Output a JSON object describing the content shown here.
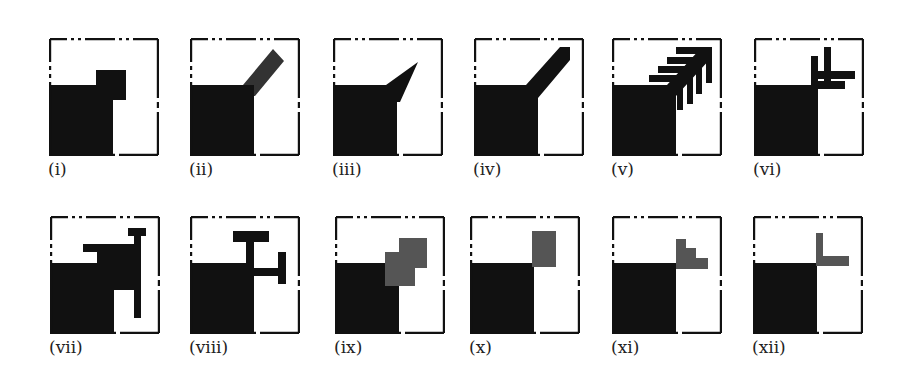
{
  "figure": {
    "panels": [
      {
        "id": "i",
        "label": "(i)",
        "x": 49,
        "y": 38,
        "desc": "square notch step"
      },
      {
        "id": "ii",
        "label": "(ii)",
        "x": 190,
        "y": 38,
        "desc": "diagonal bar gray"
      },
      {
        "id": "iii",
        "label": "(iii)",
        "x": 333,
        "y": 38,
        "desc": "triangle spike"
      },
      {
        "id": "iv",
        "label": "(iv)",
        "x": 474,
        "y": 38,
        "desc": "diagonal bar black"
      },
      {
        "id": "v",
        "label": "(v)",
        "x": 612,
        "y": 38,
        "desc": "arrow with teeth"
      },
      {
        "id": "vi",
        "label": "(vi)",
        "x": 754,
        "y": 38,
        "desc": "crossed bars"
      },
      {
        "id": "vii",
        "label": "(vii)",
        "x": 50,
        "y": 216,
        "desc": "hook shape"
      },
      {
        "id": "viii",
        "label": "(viii)",
        "x": 190,
        "y": 216,
        "desc": "T shapes"
      },
      {
        "id": "ix",
        "label": "(ix)",
        "x": 335,
        "y": 216,
        "desc": "gray steps"
      },
      {
        "id": "x",
        "label": "(x)",
        "x": 470,
        "y": 216,
        "desc": "gray rectangle"
      },
      {
        "id": "xi",
        "label": "(xi)",
        "x": 612,
        "y": 216,
        "desc": "gray staircase"
      },
      {
        "id": "xii",
        "label": "(xii)",
        "x": 753,
        "y": 216,
        "desc": "gray L"
      }
    ],
    "colors": {
      "black": "#111111",
      "gray": "#555555",
      "frame": "#111111"
    }
  }
}
